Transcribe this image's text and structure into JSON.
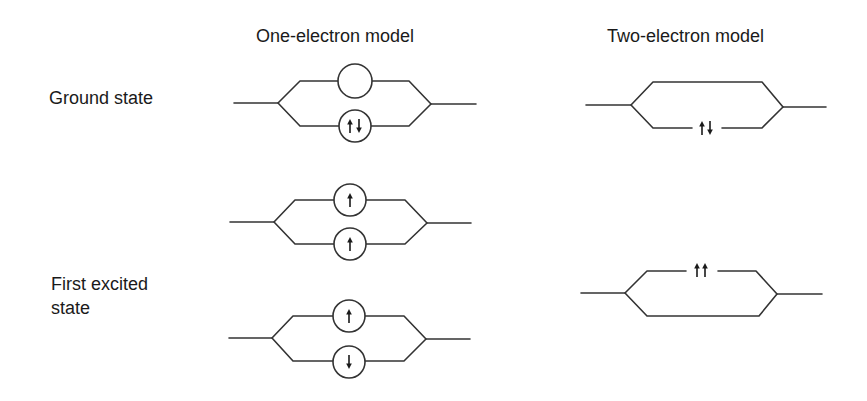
{
  "headers": {
    "one_electron": "One-electron model",
    "two_electron": "Two-electron model"
  },
  "row_labels": {
    "ground_state": "Ground state",
    "first_excited_line1": "First excited",
    "first_excited_line2": "state"
  },
  "colors": {
    "line": "#333333",
    "text": "#1a1a1a",
    "background": "#ffffff"
  },
  "diagrams": [
    {
      "id": "one-electron-ground",
      "model": "One-electron model",
      "state": "Ground state",
      "upper_orbital": "empty",
      "lower_orbital": "spin-up-down-pair"
    },
    {
      "id": "one-electron-excited-triplet",
      "model": "One-electron model",
      "state": "First excited state",
      "upper_orbital": "spin-up",
      "lower_orbital": "spin-up"
    },
    {
      "id": "one-electron-excited-singlet",
      "model": "One-electron model",
      "state": "First excited state",
      "upper_orbital": "spin-up",
      "lower_orbital": "spin-down"
    },
    {
      "id": "two-electron-ground",
      "model": "Two-electron model",
      "state": "Ground state",
      "electrons_on": "lower-path",
      "spins": "up-down"
    },
    {
      "id": "two-electron-excited",
      "model": "Two-electron model",
      "state": "First excited state",
      "electrons_on": "upper-path",
      "spins": "up-up"
    }
  ]
}
